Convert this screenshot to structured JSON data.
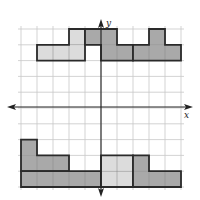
{
  "diagram": {
    "type": "coordinate-grid",
    "grid": {
      "cols": 10,
      "rows": 10,
      "origin_px": [
        21,
        29
      ],
      "cell_w": 16,
      "cell_h": 15.8,
      "line_color": "#c8c8c8"
    },
    "axes": {
      "x_label": "x",
      "y_label": "y",
      "x_axis_row": 5,
      "y_axis_col": 5,
      "color": "#222222"
    },
    "colors": {
      "light": "#dcdcdc",
      "dark": "#a9a9a9",
      "outline": "#2a2a2a"
    },
    "shapes": [
      {
        "name": "shape-top-left-light",
        "fill": "light",
        "cells": [
          [
            3,
            0
          ],
          [
            1,
            1
          ],
          [
            2,
            1
          ],
          [
            3,
            1
          ]
        ]
      },
      {
        "name": "shape-top-middle-dark",
        "fill": "dark",
        "cells": [
          [
            4,
            0
          ],
          [
            5,
            0
          ],
          [
            5,
            1
          ],
          [
            6,
            1
          ]
        ]
      },
      {
        "name": "shape-top-right-dark",
        "fill": "dark",
        "cells": [
          [
            8,
            0
          ],
          [
            7,
            1
          ],
          [
            8,
            1
          ],
          [
            9,
            1
          ]
        ]
      },
      {
        "name": "shape-bottom-left-upper-dark",
        "fill": "dark",
        "cells": [
          [
            0,
            7
          ],
          [
            0,
            8
          ],
          [
            1,
            8
          ],
          [
            2,
            8
          ]
        ]
      },
      {
        "name": "shape-bottom-left-lower-dark",
        "fill": "dark",
        "cells": [
          [
            0,
            9
          ],
          [
            1,
            9
          ],
          [
            2,
            9
          ],
          [
            3,
            9
          ],
          [
            4,
            9
          ]
        ]
      },
      {
        "name": "shape-bottom-center-light",
        "fill": "light",
        "cells": [
          [
            5,
            8
          ],
          [
            6,
            8
          ],
          [
            5,
            9
          ],
          [
            6,
            9
          ]
        ]
      },
      {
        "name": "shape-bottom-right-dark",
        "fill": "dark",
        "cells": [
          [
            7,
            8
          ],
          [
            7,
            9
          ],
          [
            8,
            9
          ],
          [
            9,
            9
          ]
        ]
      }
    ]
  }
}
